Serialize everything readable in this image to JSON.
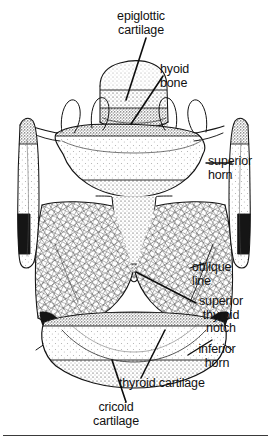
{
  "figure": {
    "caption_rule": true,
    "ink_color": "#111111",
    "background_color": "#ffffff",
    "width": 273,
    "height": 444
  },
  "labels": {
    "epiglottic_cartilage": "epiglottic\ncartilage",
    "hyoid_bone": "hyoid\nbone",
    "superior_horn": "superior\nhorn",
    "oblique_line": "oblique\nline",
    "superior_thyroid_notch": "superior\nthyroid\nnotch",
    "inferior_horn": "inferior\nhorn",
    "thyroid_cartilage": "thyroid cartilage",
    "cricoid_cartilage": "cricoid\ncartilage"
  },
  "structures": [
    {
      "name": "epiglottic cartilage",
      "label_key": "epiglottic_cartilage"
    },
    {
      "name": "hyoid bone",
      "label_key": "hyoid_bone"
    },
    {
      "name": "superior horn",
      "label_key": "superior_horn"
    },
    {
      "name": "oblique line",
      "label_key": "oblique_line"
    },
    {
      "name": "superior thyroid notch",
      "label_key": "superior_thyroid_notch"
    },
    {
      "name": "inferior horn",
      "label_key": "inferior_horn"
    },
    {
      "name": "thyroid cartilage",
      "label_key": "thyroid_cartilage"
    },
    {
      "name": "cricoid cartilage",
      "label_key": "cricoid_cartilage"
    }
  ]
}
